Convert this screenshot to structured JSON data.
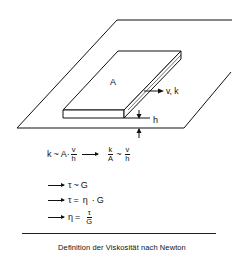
{
  "figure": {
    "labels": {
      "area": "A",
      "velocity_force": "v, k",
      "height": "h"
    },
    "formulas": {
      "line1": {
        "lhs": "k",
        "rel1": "~",
        "a": "A",
        "dot": "·",
        "frac1_num": "v",
        "frac1_den": "h",
        "frac2_num": "k",
        "frac2_den": "A",
        "rel2": "~",
        "frac3_num": "v",
        "frac3_den": "h"
      },
      "line2": {
        "lhs": "τ",
        "rel": "~",
        "rhs": "G"
      },
      "line3": {
        "lhs": "τ",
        "rel": "=",
        "eta": "η",
        "dot": "·",
        "rhs": "G"
      },
      "line4": {
        "lhs": "η",
        "rel": "=",
        "num": "τ",
        "den": "G"
      }
    },
    "caption": "Definition der Viskosität nach Newton"
  }
}
